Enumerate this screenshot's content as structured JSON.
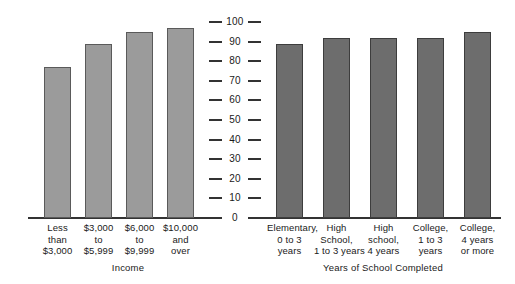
{
  "chart_data": {
    "type": "bar",
    "title": "",
    "subtitle": "",
    "orientation": "vertical",
    "layout": "back-to-back dual panel sharing one central vertical axis",
    "ylim": [
      0,
      100
    ],
    "yticks": [
      0,
      10,
      20,
      30,
      40,
      50,
      60,
      70,
      80,
      90,
      100
    ],
    "ytick_labels": [
      "0",
      "10",
      "20",
      "30",
      "40",
      "50",
      "60",
      "70",
      "80",
      "90",
      "100"
    ],
    "ylabel": "",
    "grid": false,
    "legend": "none",
    "panels": [
      {
        "name": "income",
        "xlabel": "Income",
        "bar_color": "#9b9b9b",
        "categories": [
          "Less than $3,000",
          "$3,000 to $5,999",
          "$6,000 to $9,999",
          "$10,000 and over"
        ],
        "category_lines": [
          [
            "Less",
            "than",
            "$3,000"
          ],
          [
            "$3,000",
            "to",
            "$5,999"
          ],
          [
            "$6,000",
            "to",
            "$9,999"
          ],
          [
            "$10,000",
            "and",
            "over"
          ]
        ],
        "values": [
          77,
          89,
          95,
          97
        ]
      },
      {
        "name": "education",
        "xlabel": "Years of School Completed",
        "bar_color": "#6d6d6d",
        "categories": [
          "Elementary, 0 to 3 years",
          "High School, 1 to 3 years",
          "High school, 4 years",
          "College, 1 to 3 years",
          "College, 4 years or more"
        ],
        "category_lines": [
          [
            "Elementary,",
            "0 to 3",
            "years"
          ],
          [
            "High",
            "School,",
            "1 to 3 years"
          ],
          [
            "High",
            "school,",
            "4 years"
          ],
          [
            "College,",
            "1 to 3",
            "years"
          ],
          [
            "College,",
            "4 years",
            "or more"
          ]
        ],
        "values": [
          89,
          92,
          92,
          92,
          95
        ]
      }
    ]
  },
  "colors": {
    "background": "#ffffff",
    "axis": "#333333",
    "text": "#1a1a1a",
    "bar_light": "#9b9b9b",
    "bar_dark": "#6d6d6d"
  }
}
